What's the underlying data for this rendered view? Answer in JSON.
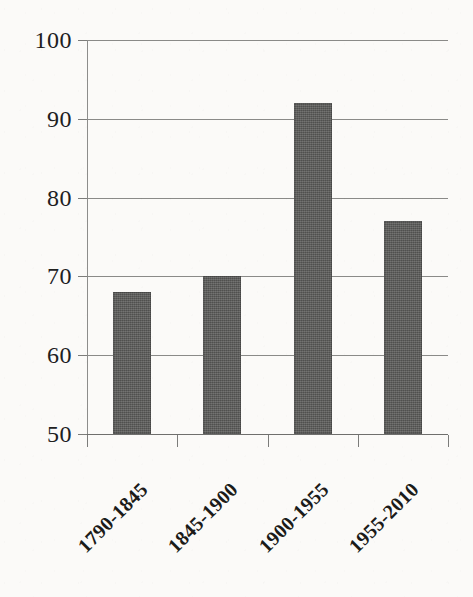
{
  "chart_data": {
    "type": "bar",
    "title": "",
    "xlabel": "",
    "ylabel": "",
    "categories": [
      "1790-1845",
      "1845-1900",
      "1900-1955",
      "1955-2010"
    ],
    "values": [
      68,
      70,
      92,
      77
    ],
    "ylim": [
      50,
      100
    ],
    "yticks": [
      50,
      60,
      70,
      80,
      90,
      100
    ],
    "ytick_labels": [
      "50",
      "60",
      "70",
      "80",
      "90",
      "100"
    ],
    "grid": true,
    "legend": "none",
    "bar_color": "#575755",
    "gridline_color": "#8a8a88",
    "axis_color": "#6f6f6d",
    "background_color": "#fbfaf8",
    "xtick_label_rotation": -45
  }
}
